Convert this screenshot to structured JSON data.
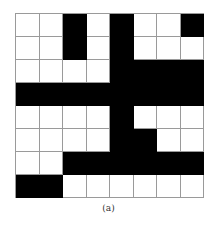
{
  "figure": {
    "caption": "(a)",
    "rows": 8,
    "cols": 8,
    "colors": {
      "filled": "#000000",
      "empty": "#ffffff",
      "gridline": "#9a9a9a"
    },
    "cells": [
      [
        0,
        0,
        1,
        0,
        1,
        0,
        0,
        1
      ],
      [
        0,
        0,
        1,
        0,
        1,
        0,
        0,
        0
      ],
      [
        0,
        0,
        0,
        0,
        1,
        1,
        1,
        1
      ],
      [
        1,
        1,
        1,
        1,
        1,
        1,
        1,
        1
      ],
      [
        0,
        0,
        0,
        0,
        1,
        0,
        0,
        0
      ],
      [
        0,
        0,
        0,
        0,
        1,
        1,
        0,
        0
      ],
      [
        0,
        0,
        1,
        1,
        1,
        1,
        1,
        1
      ],
      [
        1,
        1,
        0,
        0,
        0,
        0,
        0,
        0
      ]
    ]
  }
}
